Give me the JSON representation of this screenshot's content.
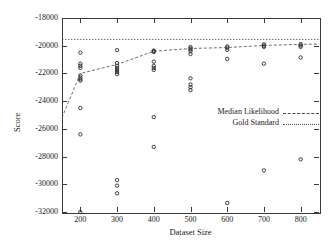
{
  "chart_data": {
    "type": "scatter",
    "title": "",
    "xlabel": "Dataset Size",
    "ylabel": "Score",
    "xlim": [
      150,
      850
    ],
    "ylim": [
      -32000,
      -18000
    ],
    "xticks": [
      200,
      300,
      400,
      500,
      600,
      700,
      800
    ],
    "yticks": [
      -18000,
      -20000,
      -22000,
      -24000,
      -26000,
      -28000,
      -30000,
      -32000
    ],
    "xtick_labels": [
      "200",
      "300",
      "400",
      "500",
      "600",
      "700",
      "800"
    ],
    "ytick_labels": [
      "-18000",
      "-20000",
      "-22000",
      "-24000",
      "-26000",
      "-28000",
      "-30000",
      "-32000"
    ],
    "grid": false,
    "legend_position": "center-right",
    "series": [
      {
        "name": "Scatter Points",
        "type": "scatter",
        "marker": "circle-open",
        "points": [
          [
            200,
            -20500
          ],
          [
            200,
            -21300
          ],
          [
            200,
            -21450
          ],
          [
            200,
            -21600
          ],
          [
            200,
            -22150
          ],
          [
            200,
            -22300
          ],
          [
            200,
            -22420
          ],
          [
            200,
            -22520
          ],
          [
            200,
            -24500
          ],
          [
            200,
            -26400
          ],
          [
            200,
            -32000
          ],
          [
            300,
            -20320
          ],
          [
            300,
            -21250
          ],
          [
            300,
            -21450
          ],
          [
            300,
            -21600
          ],
          [
            300,
            -21750
          ],
          [
            300,
            -21900
          ],
          [
            300,
            -22050
          ],
          [
            300,
            -29700
          ],
          [
            300,
            -30100
          ],
          [
            300,
            -30650
          ],
          [
            400,
            -20350
          ],
          [
            400,
            -20400
          ],
          [
            400,
            -20450
          ],
          [
            400,
            -21150
          ],
          [
            400,
            -21450
          ],
          [
            400,
            -21600
          ],
          [
            400,
            -21750
          ],
          [
            400,
            -25150
          ],
          [
            400,
            -27300
          ],
          [
            500,
            -20100
          ],
          [
            500,
            -20200
          ],
          [
            500,
            -20280
          ],
          [
            500,
            -20400
          ],
          [
            500,
            -20600
          ],
          [
            500,
            -22350
          ],
          [
            500,
            -22800
          ],
          [
            500,
            -23000
          ],
          [
            500,
            -23200
          ],
          [
            600,
            -20050
          ],
          [
            600,
            -20150
          ],
          [
            600,
            -20300
          ],
          [
            600,
            -20950
          ],
          [
            600,
            -31350
          ],
          [
            700,
            -19900
          ],
          [
            700,
            -20000
          ],
          [
            700,
            -20080
          ],
          [
            700,
            -21300
          ],
          [
            700,
            -29000
          ],
          [
            800,
            -19880
          ],
          [
            800,
            -19980
          ],
          [
            800,
            -20080
          ],
          [
            800,
            -20850
          ],
          [
            800,
            -28200
          ]
        ]
      },
      {
        "name": "Median Likelihood",
        "type": "line",
        "linestyle": "dashed",
        "points": [
          [
            150,
            -25200
          ],
          [
            200,
            -22000
          ],
          [
            300,
            -21350
          ],
          [
            400,
            -20400
          ],
          [
            500,
            -20200
          ],
          [
            600,
            -20130
          ],
          [
            700,
            -19980
          ],
          [
            800,
            -19900
          ],
          [
            850,
            -19880
          ]
        ]
      },
      {
        "name": "Gold Standard",
        "type": "line",
        "linestyle": "dotted",
        "points": [
          [
            150,
            -19550
          ],
          [
            850,
            -19550
          ]
        ]
      }
    ],
    "legend": [
      {
        "label": "Median Likelihood",
        "style": "dashed"
      },
      {
        "label": "Gold Standard",
        "style": "dotted"
      }
    ]
  },
  "colors": {
    "axis": "#3a3a3a",
    "marker": "#2b2b2b",
    "line": "#4a4a4a",
    "background": "#ffffff"
  }
}
